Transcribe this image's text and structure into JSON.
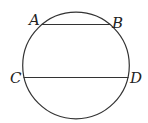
{
  "diagram": {
    "points": {
      "A": "A",
      "B": "B",
      "C": "C",
      "D": "D"
    },
    "shapes": [
      {
        "type": "circle",
        "name": "circle"
      },
      {
        "type": "chord",
        "name": "AB",
        "from": "A",
        "to": "B"
      },
      {
        "type": "chord",
        "name": "CD",
        "from": "C",
        "to": "D"
      }
    ],
    "stroke_color": "#333333"
  }
}
